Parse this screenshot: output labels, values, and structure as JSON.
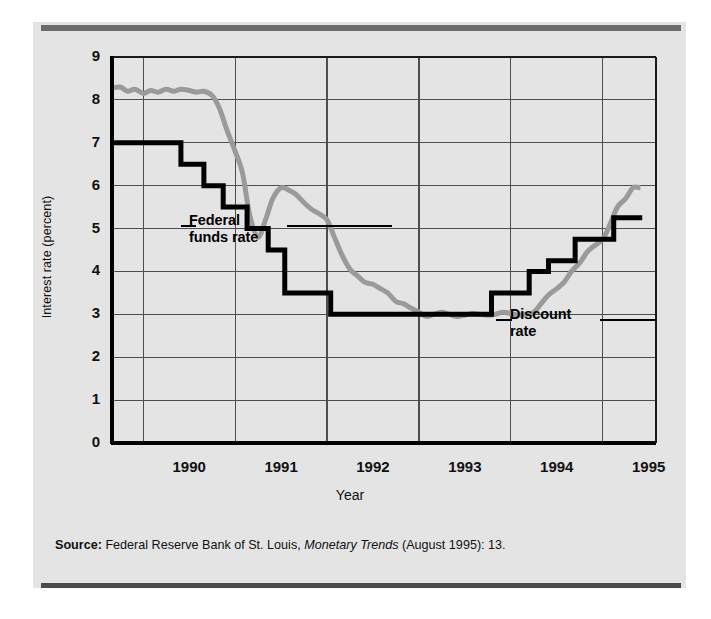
{
  "figure": {
    "source_prefix": "Source:",
    "source_text_1": " Federal Reserve Bank of St. Louis, ",
    "source_italic": "Monetary Trends",
    "source_text_2": " (August 1995): 13."
  },
  "chart_data": {
    "type": "line",
    "title": "",
    "xlabel": "Year",
    "ylabel": "Interest rate (percent)",
    "ylim": [
      0,
      9
    ],
    "xlim": [
      1989.58,
      1995.5
    ],
    "grid": true,
    "legend_position": "inline-annotation",
    "ytick_labels": [
      "0",
      "1",
      "2",
      "3",
      "4",
      "5",
      "6",
      "7",
      "8",
      "9"
    ],
    "ytick_values": [
      0,
      1,
      2,
      3,
      4,
      5,
      6,
      7,
      8,
      9
    ],
    "xtick_labels": [
      "1990",
      "1991",
      "1992",
      "1993",
      "1994",
      "1995"
    ],
    "xtick_values": [
      1990,
      1991,
      1992,
      1993,
      1994,
      1995
    ],
    "annotations": [
      {
        "label": "Federal\nfunds rate",
        "series": "Federal funds rate",
        "color": "#999999"
      },
      {
        "label": "Discount\nrate",
        "series": "Discount rate",
        "color": "#000000"
      }
    ],
    "series": [
      {
        "name": "Federal funds rate",
        "color": "#9a9a9a",
        "linewidth": 5,
        "style": "smooth",
        "x": [
          1989.58,
          1989.67,
          1989.75,
          1989.83,
          1989.92,
          1990.0,
          1990.08,
          1990.17,
          1990.25,
          1990.33,
          1990.42,
          1990.5,
          1990.58,
          1990.67,
          1990.75,
          1990.83,
          1990.92,
          1991.0,
          1991.08,
          1991.17,
          1991.25,
          1991.33,
          1991.42,
          1991.5,
          1991.58,
          1991.67,
          1991.75,
          1991.83,
          1991.92,
          1992.0,
          1992.08,
          1992.17,
          1992.25,
          1992.33,
          1992.42,
          1992.5,
          1992.58,
          1992.67,
          1992.75,
          1992.83,
          1992.92,
          1993.0,
          1993.08,
          1993.17,
          1993.25,
          1993.33,
          1993.42,
          1993.5,
          1993.58,
          1993.67,
          1993.75,
          1993.83,
          1993.92,
          1994.0,
          1994.08,
          1994.17,
          1994.25,
          1994.33,
          1994.42,
          1994.5,
          1994.58,
          1994.67,
          1994.75,
          1994.83,
          1994.92,
          1995.0,
          1995.08,
          1995.17,
          1995.25,
          1995.33
        ],
        "y": [
          8.28,
          8.3,
          8.2,
          8.25,
          8.15,
          8.22,
          8.18,
          8.25,
          8.2,
          8.25,
          8.22,
          8.18,
          8.2,
          8.1,
          7.8,
          7.3,
          6.8,
          6.3,
          5.3,
          4.8,
          5.2,
          5.7,
          5.95,
          5.9,
          5.8,
          5.6,
          5.45,
          5.35,
          5.2,
          4.8,
          4.4,
          4.05,
          3.9,
          3.75,
          3.7,
          3.6,
          3.5,
          3.3,
          3.25,
          3.15,
          3.05,
          2.95,
          3.0,
          3.05,
          3.0,
          2.95,
          2.98,
          3.02,
          3.0,
          2.98,
          3.0,
          3.05,
          3.02,
          2.98,
          3.0,
          3.05,
          3.25,
          3.45,
          3.6,
          3.75,
          4.0,
          4.2,
          4.45,
          4.6,
          4.75,
          5.1,
          5.5,
          5.7,
          5.95,
          5.95
        ],
        "final_value": 5.95
      },
      {
        "name": "Discount rate",
        "color": "#000000",
        "linewidth": 5,
        "style": "step",
        "x": [
          1989.58,
          1990.33,
          1990.33,
          1990.58,
          1990.58,
          1990.79,
          1990.79,
          1991.05,
          1991.05,
          1991.28,
          1991.28,
          1991.46,
          1991.46,
          1991.96,
          1991.96,
          1993.71,
          1993.71,
          1994.12,
          1994.12,
          1994.33,
          1994.33,
          1994.62,
          1994.62,
          1995.04,
          1995.04,
          1995.35
        ],
        "y": [
          7.0,
          7.0,
          6.5,
          6.5,
          6.0,
          6.0,
          5.5,
          5.5,
          5.0,
          5.0,
          4.5,
          4.5,
          3.5,
          3.5,
          3.0,
          3.0,
          3.5,
          3.5,
          4.0,
          4.0,
          4.25,
          4.25,
          4.75,
          4.75,
          5.25,
          5.25
        ],
        "final_value": 5.25
      }
    ]
  }
}
